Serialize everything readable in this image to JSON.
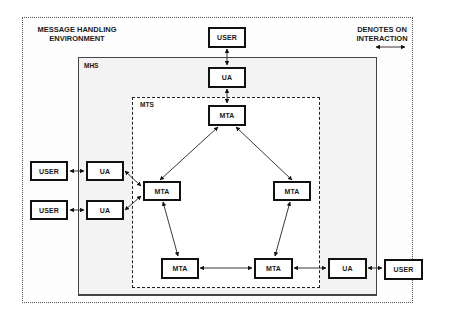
{
  "diagram": {
    "environment": {
      "label_line1": "MESSAGE HANDLING",
      "label_line2": "ENVIRONMENT"
    },
    "mhs": {
      "label": "MHS"
    },
    "mts": {
      "label": "MTS"
    },
    "legend": {
      "line1": "DENOTES ON",
      "line2": "INTERACTION",
      "symbol": "double-arrow"
    },
    "nodes": {
      "user_top": "USER",
      "ua_top": "UA",
      "mta_top": "MTA",
      "mta_left": "MTA",
      "mta_right": "MTA",
      "mta_bottom_left": "MTA",
      "mta_bottom_right": "MTA",
      "ua_right": "UA",
      "user_right": "USER",
      "user_left_1": "USER",
      "ua_left_1": "UA",
      "user_left_2": "USER",
      "ua_left_2": "UA"
    },
    "edges": [
      [
        "user_top",
        "ua_top"
      ],
      [
        "ua_top",
        "mta_top"
      ],
      [
        "mta_top",
        "mta_left"
      ],
      [
        "mta_top",
        "mta_right"
      ],
      [
        "mta_left",
        "mta_bottom_left"
      ],
      [
        "mta_right",
        "mta_bottom_right"
      ],
      [
        "mta_bottom_left",
        "mta_bottom_right"
      ],
      [
        "mta_bottom_right",
        "ua_right"
      ],
      [
        "ua_right",
        "user_right"
      ],
      [
        "user_left_1",
        "ua_left_1"
      ],
      [
        "user_left_2",
        "ua_left_2"
      ],
      [
        "ua_left_1",
        "mta_left"
      ],
      [
        "ua_left_2",
        "mta_left"
      ]
    ]
  }
}
